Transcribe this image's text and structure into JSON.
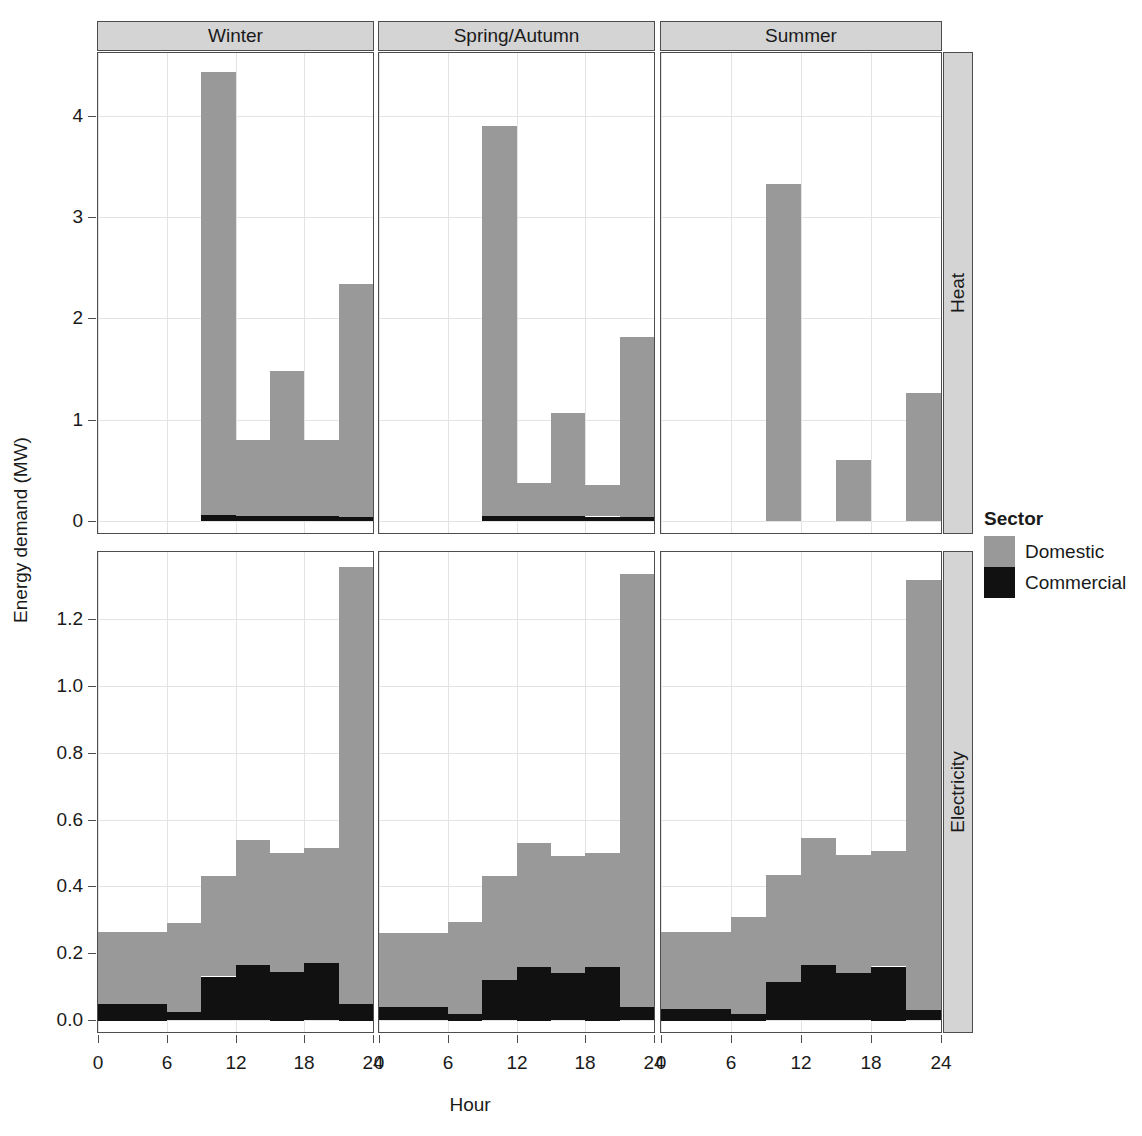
{
  "chart_data": {
    "type": "bar",
    "title": "",
    "subtitle": "",
    "xlabel": "Hour",
    "ylabel": "Energy demand (MW)",
    "grid": true,
    "legend": {
      "title": "Sector",
      "position": "right",
      "entries": [
        {
          "name": "Domestic",
          "color": "#999999"
        },
        {
          "name": "Commercial",
          "color": "#111111"
        }
      ]
    },
    "facet_columns": [
      "Winter",
      "Spring/Autumn",
      "Summer"
    ],
    "facet_rows": [
      "Heat",
      "Electricity"
    ],
    "x": [
      0,
      3,
      6,
      9,
      12,
      15,
      18,
      21
    ],
    "x_bin_width": 3,
    "xlim": [
      0,
      24
    ],
    "xticks": [
      0,
      6,
      12,
      18,
      24
    ],
    "xticklabels": [
      "0",
      "6",
      "12",
      "18",
      "24"
    ],
    "panels": [
      {
        "row": "Heat",
        "column": "Winter",
        "ylim": [
          -0.12,
          4.62
        ],
        "yticks": [
          0,
          1,
          2,
          3,
          4
        ],
        "yticklabels": [
          "0",
          "1",
          "2",
          "3",
          "4"
        ],
        "series": [
          {
            "name": "Domestic",
            "values": [
              0.0,
              0.0,
              0.0,
              4.38,
              0.75,
              1.43,
              0.75,
              2.3
            ]
          },
          {
            "name": "Commercial",
            "values": [
              0.0,
              0.0,
              0.0,
              0.055,
              0.05,
              0.05,
              0.045,
              0.04
            ]
          }
        ]
      },
      {
        "row": "Heat",
        "column": "Spring/Autumn",
        "ylim": [
          -0.12,
          4.62
        ],
        "yticks": [
          0,
          1,
          2,
          3,
          4
        ],
        "yticklabels": [
          "0",
          "1",
          "2",
          "3",
          "4"
        ],
        "series": [
          {
            "name": "Domestic",
            "values": [
              0.0,
              0.0,
              0.0,
              3.85,
              0.33,
              1.02,
              0.31,
              1.78
            ]
          },
          {
            "name": "Commercial",
            "values": [
              0.0,
              0.0,
              0.0,
              0.05,
              0.045,
              0.045,
              0.04,
              0.035
            ]
          }
        ]
      },
      {
        "row": "Heat",
        "column": "Summer",
        "ylim": [
          -0.12,
          4.62
        ],
        "yticks": [
          0,
          1,
          2,
          3,
          4
        ],
        "yticklabels": [
          "0",
          "1",
          "2",
          "3",
          "4"
        ],
        "series": [
          {
            "name": "Domestic",
            "values": [
              0.0,
              0.0,
              0.0,
              3.33,
              0.0,
              0.6,
              0.0,
              1.26
            ]
          },
          {
            "name": "Commercial",
            "values": [
              0.0,
              0.0,
              0.0,
              0.0,
              0.0,
              0.0,
              0.0,
              0.0
            ]
          }
        ]
      },
      {
        "row": "Electricity",
        "column": "Winter",
        "ylim": [
          -0.035,
          1.4
        ],
        "yticks": [
          0.0,
          0.2,
          0.4,
          0.6,
          0.8,
          1.0,
          1.2
        ],
        "yticklabels": [
          "0.0",
          "0.2",
          "0.4",
          "0.6",
          "0.8",
          "1.0",
          "1.2"
        ],
        "series": [
          {
            "name": "Domestic",
            "values": [
              0.215,
              0.215,
              0.265,
              0.3,
              0.375,
              0.355,
              0.345,
              1.305
            ]
          },
          {
            "name": "Commercial",
            "values": [
              0.05,
              0.05,
              0.025,
              0.13,
              0.165,
              0.145,
              0.17,
              0.05
            ]
          }
        ]
      },
      {
        "row": "Electricity",
        "column": "Spring/Autumn",
        "ylim": [
          -0.035,
          1.4
        ],
        "yticks": [
          0.0,
          0.2,
          0.4,
          0.6,
          0.8,
          1.0,
          1.2
        ],
        "yticklabels": [
          "0.0",
          "0.2",
          "0.4",
          "0.6",
          "0.8",
          "1.0",
          "1.2"
        ],
        "series": [
          {
            "name": "Domestic",
            "values": [
              0.22,
              0.22,
              0.275,
              0.31,
              0.37,
              0.35,
              0.34,
              1.295
            ]
          },
          {
            "name": "Commercial",
            "values": [
              0.04,
              0.04,
              0.02,
              0.12,
              0.16,
              0.14,
              0.16,
              0.04
            ]
          }
        ]
      },
      {
        "row": "Electricity",
        "column": "Summer",
        "ylim": [
          -0.035,
          1.4
        ],
        "yticks": [
          0.0,
          0.2,
          0.4,
          0.6,
          0.8,
          1.0,
          1.2
        ],
        "yticklabels": [
          "0.0",
          "0.2",
          "0.4",
          "0.6",
          "0.8",
          "1.0",
          "1.2"
        ],
        "series": [
          {
            "name": "Domestic",
            "values": [
              0.23,
              0.23,
              0.29,
              0.32,
              0.38,
              0.355,
              0.345,
              1.285
            ]
          },
          {
            "name": "Commercial",
            "values": [
              0.035,
              0.035,
              0.02,
              0.115,
              0.165,
              0.14,
              0.16,
              0.03
            ]
          }
        ]
      }
    ]
  }
}
